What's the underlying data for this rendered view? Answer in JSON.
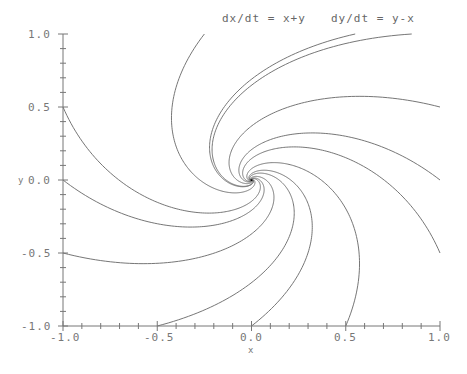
{
  "chart_data": {
    "type": "line",
    "title": "dx/dt = x+y      dy/dt = y-x",
    "title_parts": [
      "dx/dt = x+y",
      "dy/dt = y-x"
    ],
    "xlabel": "x",
    "ylabel": "y",
    "xlim": [
      -1.0,
      1.0
    ],
    "ylim": [
      -1.0,
      1.0
    ],
    "x_ticks": [
      "-1.0",
      "-0.5",
      "0.0",
      "0.5",
      "1.0"
    ],
    "y_ticks": [
      "1.0",
      "0.5",
      "0.0",
      "-0.5",
      "-1.0"
    ],
    "grid": false,
    "trajectory_boundary_points": [
      {
        "x": -1.0,
        "y": 0.5
      },
      {
        "x": -1.0,
        "y": 0.0
      },
      {
        "x": -1.0,
        "y": -0.5
      },
      {
        "x": -0.5,
        "y": -1.0
      },
      {
        "x": 0.0,
        "y": -1.0
      },
      {
        "x": 0.5,
        "y": -1.0
      },
      {
        "x": 1.0,
        "y": -0.5
      },
      {
        "x": 1.0,
        "y": 0.0
      },
      {
        "x": 1.0,
        "y": 0.5
      },
      {
        "x": 0.55,
        "y": 1.0
      },
      {
        "x": -0.25,
        "y": 1.0
      },
      {
        "x": 0.85,
        "y": 1.0
      }
    ]
  }
}
